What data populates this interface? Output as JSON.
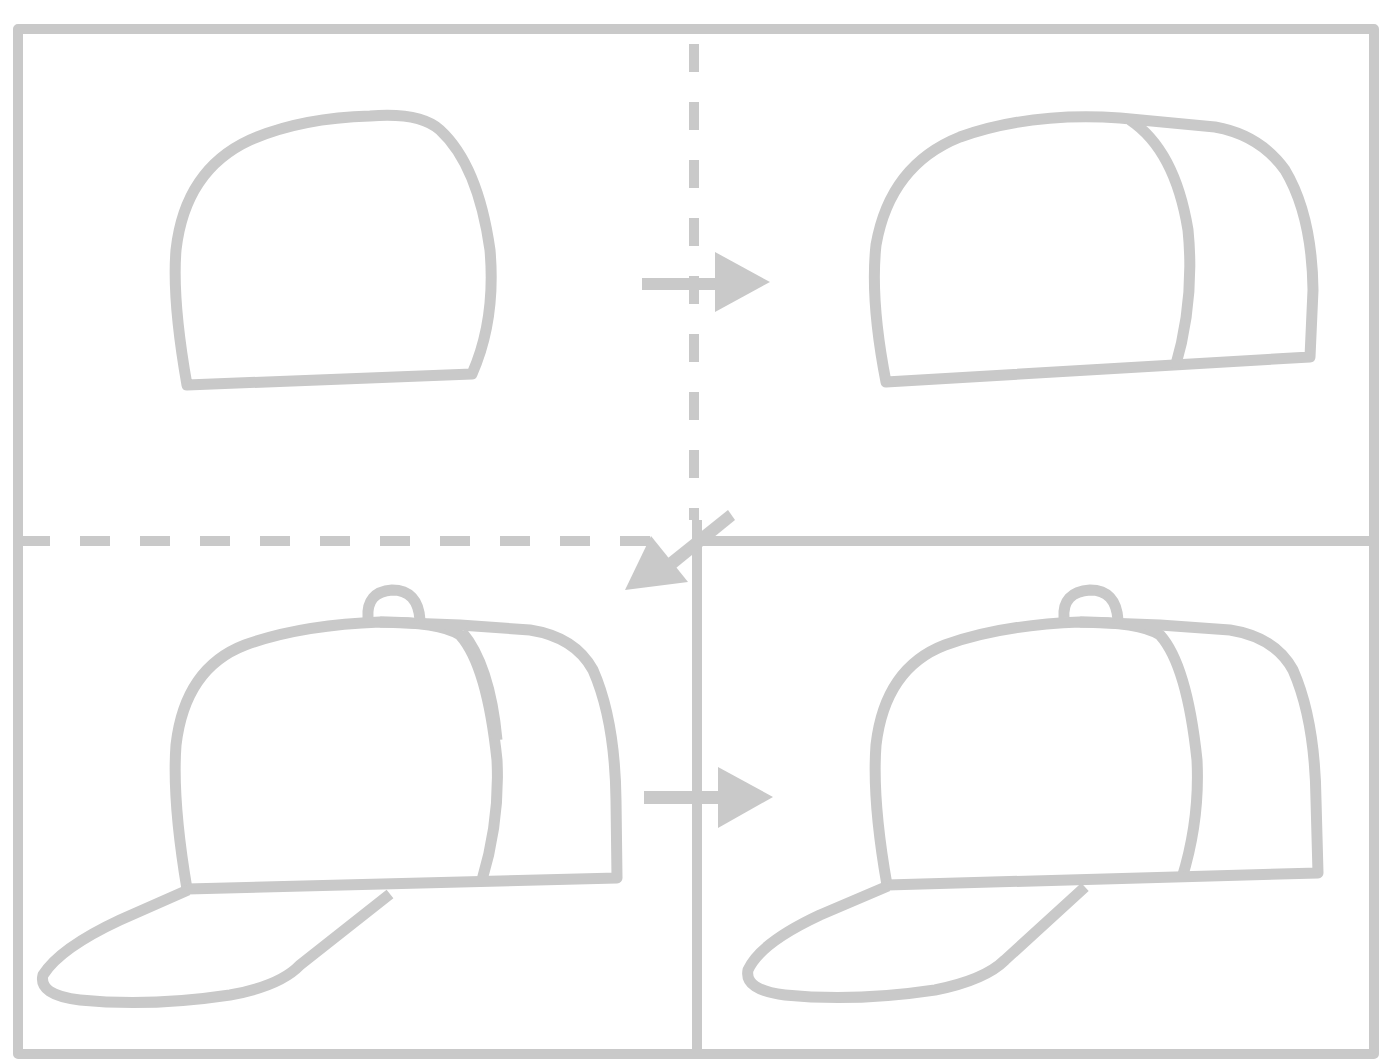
{
  "diagram": {
    "type": "step-by-step drawing guide",
    "colors": {
      "background": "#ffffff",
      "line": "#c9c9c9"
    },
    "layout": "2x2 grid",
    "steps": [
      {
        "index": 1,
        "position": "top-left",
        "description": "Draw the crown outline of the cap"
      },
      {
        "index": 2,
        "position": "top-right",
        "description": "Add a curved seam and back panel"
      },
      {
        "index": 3,
        "position": "bottom-left",
        "description": "Add the button on top and the brim"
      },
      {
        "index": 4,
        "position": "bottom-right",
        "description": "Finished cap"
      }
    ],
    "arrows": [
      {
        "from": 1,
        "to": 2,
        "direction": "right"
      },
      {
        "from": 2,
        "to": 3,
        "direction": "down-left"
      },
      {
        "from": 3,
        "to": 4,
        "direction": "right"
      }
    ]
  }
}
